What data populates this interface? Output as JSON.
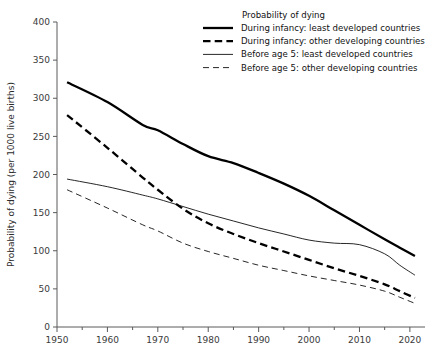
{
  "chart_data": {
    "type": "line",
    "title": "",
    "xlabel": "",
    "ylabel": "Probability of dying (per 1000 live births)",
    "xlim": [
      1950,
      2023
    ],
    "ylim": [
      0,
      400
    ],
    "xticks": [
      1950,
      1960,
      1970,
      1980,
      1990,
      2000,
      2010,
      2020
    ],
    "xticklabels": [
      "1950",
      "1960",
      "1970",
      "1980",
      "1990",
      "2000",
      "2010",
      "2020"
    ],
    "minor_xticks": [
      1955,
      1965,
      1975,
      1985,
      1995,
      2005,
      2015
    ],
    "yticks": [
      0,
      50,
      100,
      150,
      200,
      250,
      300,
      350,
      400
    ],
    "yticklabels": [
      "0",
      "50",
      "100",
      "150",
      "200",
      "250",
      "300",
      "350",
      "400"
    ],
    "grid": false,
    "legend_position": "top-right",
    "legend_title": "Probability of dying",
    "series": [
      {
        "name": "During infancy: least developed countries",
        "style": "thick-solid",
        "x": [
          1952,
          1960,
          1967,
          1970,
          1975,
          1980,
          1985,
          1990,
          1995,
          2000,
          2005,
          2010,
          2015,
          2018,
          2021
        ],
        "values": [
          321,
          295,
          265,
          258,
          240,
          224,
          215,
          202,
          188,
          172,
          153,
          134,
          115,
          104,
          93
        ]
      },
      {
        "name": "During infancy: other developing countries",
        "style": "thick-dash",
        "x": [
          1952,
          1960,
          1967,
          1970,
          1975,
          1980,
          1985,
          1990,
          1995,
          2000,
          2005,
          2010,
          2015,
          2018,
          2021
        ],
        "values": [
          278,
          235,
          196,
          180,
          155,
          136,
          122,
          110,
          99,
          88,
          77,
          67,
          56,
          47,
          38
        ]
      },
      {
        "name": "Before age 5: least developed countries",
        "style": "thin-solid",
        "x": [
          1952,
          1960,
          1967,
          1970,
          1975,
          1980,
          1985,
          1990,
          1995,
          2000,
          2005,
          2010,
          2015,
          2018,
          2021
        ],
        "values": [
          194,
          184,
          173,
          168,
          158,
          148,
          139,
          130,
          122,
          114,
          110,
          108,
          96,
          81,
          68
        ]
      },
      {
        "name": "Before age 5: other developing countries",
        "style": "thin-dash",
        "x": [
          1952,
          1960,
          1967,
          1970,
          1975,
          1980,
          1985,
          1990,
          1995,
          2000,
          2005,
          2010,
          2015,
          2018,
          2021
        ],
        "values": [
          180,
          156,
          134,
          126,
          110,
          99,
          90,
          81,
          74,
          67,
          61,
          55,
          47,
          39,
          31
        ]
      }
    ]
  },
  "legend": {
    "title": "Probability of dying",
    "entries": [
      {
        "label": "During infancy: least developed countries",
        "style": "thick-solid"
      },
      {
        "label": "During infancy: other developing countries",
        "style": "thick-dash"
      },
      {
        "label": "Before age 5: least developed countries",
        "style": "thin-solid"
      },
      {
        "label": "Before age 5: other developing countries",
        "style": "thin-dash"
      }
    ]
  },
  "axes": {
    "ylabel": "Probability of dying (per 1000 live births)"
  },
  "colors": {
    "line": "#000000",
    "axis": "#5a5a5a",
    "tick_text": "#3a3a3a",
    "background": "#ffffff"
  }
}
